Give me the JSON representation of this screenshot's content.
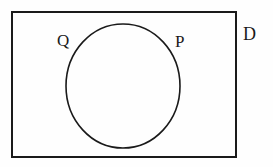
{
  "diagram": {
    "type": "venn-diagram",
    "universal_set": {
      "label": "D",
      "shape": "rectangle",
      "x": 11,
      "y": 11,
      "width": 225,
      "height": 146,
      "stroke_color": "#1a1a1a",
      "stroke_width": 2,
      "fill": "none",
      "label_position": "outside-top-right"
    },
    "circle": {
      "shape": "ellipse",
      "center_x": 123,
      "center_y": 86,
      "radius_x": 57,
      "radius_y": 62,
      "stroke_color": "#1a1a1a",
      "stroke_width": 1.5,
      "fill": "none"
    },
    "labels": [
      {
        "name": "Q",
        "text": "Q",
        "x": 57,
        "y": 32,
        "placement": "outside-circle-left"
      },
      {
        "name": "P",
        "text": "P",
        "x": 175,
        "y": 33,
        "placement": "inside-circle-right"
      },
      {
        "name": "D",
        "text": "D",
        "x": 243,
        "y": 25,
        "placement": "outside-rectangle-right"
      }
    ],
    "colors": {
      "background": "#fefefe",
      "ink": "#1a1a1a"
    }
  }
}
